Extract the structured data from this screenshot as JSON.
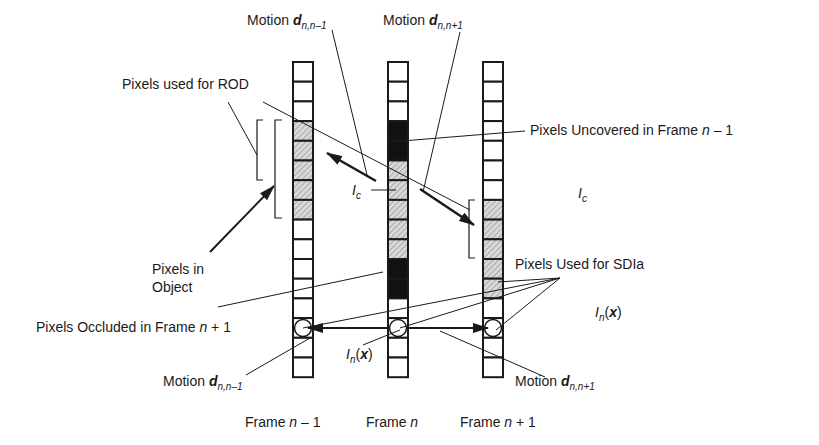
{
  "diagram": {
    "colors": {
      "stroke": "#1a1a1a",
      "hatch_bg": "#d9d9d9",
      "hatch_line": "#7a7a7a",
      "black_fill": "#111111",
      "cell_bg": "#ffffff"
    },
    "frames": [
      {
        "id": "frame-n-minus-1",
        "label_prefix": "Frame ",
        "label_var": "n",
        "label_suffix": " – 1",
        "cells": [
          "white",
          "white",
          "white",
          "hatched",
          "hatched",
          "hatched",
          "hatched",
          "hatched",
          "white",
          "white",
          "white",
          "white",
          "white",
          "circle",
          "white",
          "white"
        ]
      },
      {
        "id": "frame-n",
        "label_prefix": "Frame ",
        "label_var": "n",
        "label_suffix": "",
        "cells": [
          "white",
          "white",
          "white",
          "black",
          "black",
          "hatched",
          "hatched",
          "hatched",
          "hatched",
          "hatched",
          "black",
          "black",
          "white",
          "circle",
          "white",
          "white"
        ]
      },
      {
        "id": "frame-n-plus-1",
        "label_prefix": "Frame ",
        "label_var": "n",
        "label_suffix": " + 1",
        "cells": [
          "white",
          "white",
          "white",
          "white",
          "white",
          "white",
          "white",
          "hatched",
          "hatched",
          "hatched",
          "hatched",
          "hatched",
          "white",
          "circle",
          "white",
          "white"
        ]
      }
    ],
    "labels": {
      "motion_top_left": {
        "word": "Motion ",
        "var": "d",
        "sub": "n,n–1"
      },
      "motion_top_right": {
        "word": "Motion ",
        "var": "d",
        "sub": "n,n+1"
      },
      "motion_bottom_left": {
        "word": "Motion ",
        "var": "d",
        "sub": "n,n–1"
      },
      "motion_bottom_right": {
        "word": "Motion ",
        "var": "d",
        "sub": "n,n+1"
      },
      "pixels_rod": "Pixels used for ROD",
      "pixels_uncovered_prefix": "Pixels Uncovered in Frame ",
      "pixels_uncovered_var": "n",
      "pixels_uncovered_suffix": " – 1",
      "pixels_in_object_line1": "Pixels in",
      "pixels_in_object_line2": "Object",
      "pixels_occluded_prefix": "Pixels Occluded in Frame ",
      "pixels_occluded_var": "n",
      "pixels_occluded_suffix": " + 1",
      "pixels_sdia": "Pixels Used for SDIa",
      "ic_center": {
        "var": "I",
        "sub": "c"
      },
      "ic_right": {
        "var": "I",
        "sub": "c"
      },
      "in_x_center": {
        "var": "I",
        "sub": "n",
        "arg_open": "(",
        "arg": "x",
        "arg_close": ")"
      },
      "in_x_right": {
        "var": "I",
        "sub": "n",
        "arg_open": "(",
        "arg": "x",
        "arg_close": ")"
      }
    }
  }
}
